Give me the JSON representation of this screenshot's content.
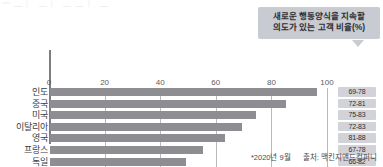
{
  "top_sliver": {
    "text": "〰 ﹏ ︴ ﹏ ︴ ﹏ ﹏ ︴ ﹏"
  },
  "callout": {
    "line1": "새로운 행동양식을 지속할",
    "line2": "의도가 있는 고객 비율(%)"
  },
  "footer": {
    "date": "*2020년 9월",
    "source": "출처: 맥킨지앤드컴퍼니"
  },
  "colors": {
    "bar": "#8d8d92",
    "callout_bg": "#c9cbd2",
    "range_bg": "#d2d3d8",
    "axis": "#7d7d82",
    "grid": "#b9b9be"
  },
  "chart_data": {
    "type": "bar",
    "orientation": "horizontal",
    "title": "새로운 행동양식을 지속할 의도가 있는 고객 비율(%)",
    "xlabel": "",
    "ylabel": "",
    "xlim": [
      0,
      100
    ],
    "xticks": [
      0,
      20,
      40,
      60,
      80,
      100
    ],
    "grid": true,
    "legend": "none",
    "categories": [
      "인도",
      "중국",
      "미국",
      "이탈리아",
      "영국",
      "프랑스",
      "독일",
      "일본"
    ],
    "values": [
      96,
      85,
      74,
      69,
      63,
      55,
      49,
      31
    ],
    "range_labels": [
      "69-78",
      "72-81",
      "75-83",
      "72-83",
      "81-88",
      "67-78",
      "66-82",
      "83-92"
    ]
  }
}
